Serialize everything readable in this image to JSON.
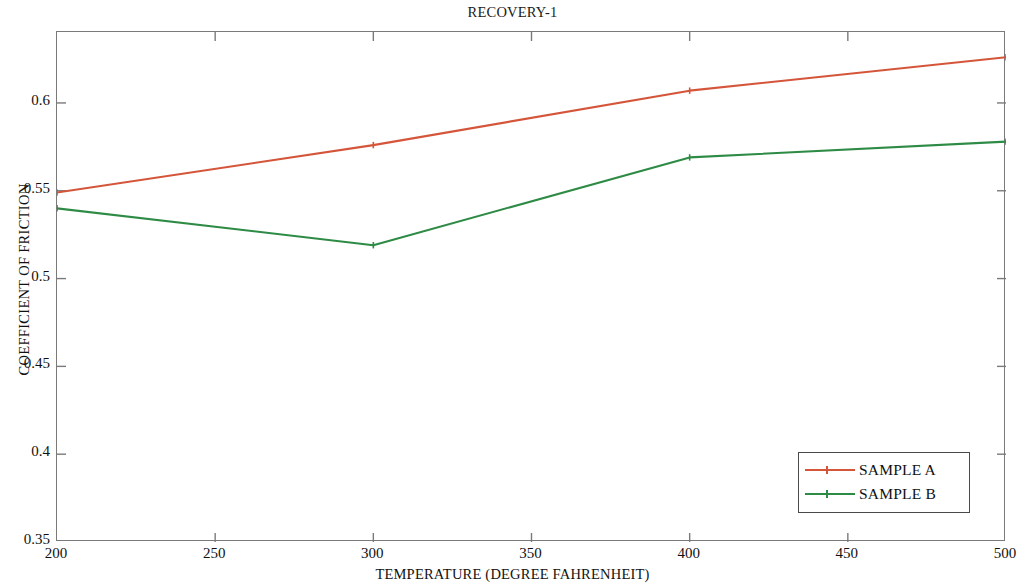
{
  "chart_data": {
    "type": "line",
    "title": "RECOVERY-1",
    "xlabel": "TEMPERATURE (DEGREE FAHRENHEIT)",
    "ylabel": "COEFFICIENT OF FRICTION",
    "x": [
      200,
      300,
      400,
      500
    ],
    "xlim": [
      200,
      500
    ],
    "ylim": [
      0.35,
      0.6404
    ],
    "xticks": [
      200,
      250,
      300,
      350,
      400,
      450,
      500
    ],
    "xtick_labels": [
      "200",
      "250",
      "300",
      "350",
      "400",
      "450",
      "500"
    ],
    "yticks": [
      0.35,
      0.4,
      0.45,
      0.5,
      0.55,
      0.6
    ],
    "ytick_labels": [
      "0.35",
      "0.4",
      "0.45",
      "0.5",
      "0.55",
      "0.6"
    ],
    "grid": false,
    "legend_position": "lower right",
    "series": [
      {
        "name": "SAMPLE A",
        "color": "#d4553a",
        "values": [
          0.549,
          0.576,
          0.607,
          0.626
        ]
      },
      {
        "name": "SAMPLE B",
        "color": "#2e8b45",
        "values": [
          0.54,
          0.519,
          0.569,
          0.578
        ]
      }
    ]
  },
  "legend": {
    "entries": [
      {
        "label": "SAMPLE A"
      },
      {
        "label": "SAMPLE B"
      }
    ]
  }
}
